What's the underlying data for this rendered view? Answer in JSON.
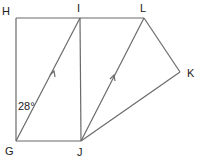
{
  "diagram": {
    "points": {
      "H": {
        "label": "H",
        "x": 16,
        "y": 18,
        "lx": 2,
        "ly": 15
      },
      "I": {
        "label": "I",
        "x": 80,
        "y": 18,
        "lx": 77,
        "ly": 12
      },
      "L": {
        "label": "L",
        "x": 144,
        "y": 18,
        "lx": 140,
        "ly": 12
      },
      "K": {
        "label": "K",
        "x": 180,
        "y": 72,
        "lx": 187,
        "ly": 77
      },
      "G": {
        "label": "G",
        "x": 16,
        "y": 141,
        "lx": 5,
        "ly": 155
      },
      "J": {
        "label": "J",
        "x": 81,
        "y": 141,
        "lx": 77,
        "ly": 156
      }
    },
    "segments": [
      [
        "H",
        "I"
      ],
      [
        "I",
        "L"
      ],
      [
        "H",
        "G"
      ],
      [
        "G",
        "J"
      ],
      [
        "I",
        "J"
      ],
      [
        "G",
        "I"
      ],
      [
        "J",
        "L"
      ],
      [
        "L",
        "K"
      ],
      [
        "K",
        "J"
      ]
    ],
    "parallel_marks": [
      "GI",
      "JL"
    ],
    "angle_label": {
      "text": "28°",
      "x": 18,
      "y": 110
    }
  }
}
